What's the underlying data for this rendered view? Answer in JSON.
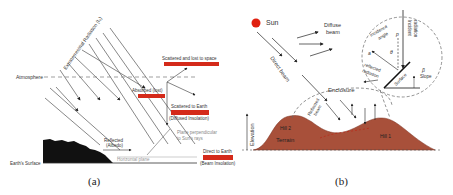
{
  "panel_a": {
    "caption": "(a)",
    "extraterrestrial_label": "Extraterrestrial Radiation (I₀)",
    "atmosphere_label": "Atmosphere",
    "scattered_lost_label": "Scattered and lost to space",
    "absorbed_label": "Absorbed (lost)",
    "scattered_earth_label": "Scattered to Earth",
    "diffused_label": "(Diffused Insolation)",
    "plane_perp_label_1": "Plane perpendicular",
    "plane_perp_label_2": "to Sun's rays",
    "reflected_label": "Reflected",
    "albedo_label": "(Albedo)",
    "horizontal_plane_label": "Horizontal plane",
    "direct_label": "Direct to Earth",
    "beam_label": "(Beam Insolation)",
    "surface_label": "Earth's Surface",
    "bar_color": "#d42a1a"
  },
  "panel_b": {
    "caption": "(b)",
    "sun_label": "Sun",
    "diffuse_label_1": "Diffuse",
    "diffuse_label_2": "beam",
    "direct_beam_label": "Direct beam",
    "enclosure_label": "Enclosure",
    "reflected_beam_label_1": "Reflected",
    "reflected_beam_label_2": "beam",
    "hill1_label": "Hill 1",
    "hill2_label": "Hill 2",
    "terrain_label": "Terrain",
    "elevation_label": "Elevation",
    "incidence_label_1": "Incidence",
    "incidence_label_2": "angle",
    "incident_label_1": "Incident",
    "incident_label_2": "radiation",
    "reflected_rad_label_1": "reflected",
    "reflected_rad_label_2": "radiation",
    "surface_label": "Surface",
    "slope_label": "Slope",
    "beta": "β",
    "theta": "θ",
    "p": "p",
    "a": "a",
    "sun_color": "#e02010",
    "terrain_color": "#a8503a"
  }
}
